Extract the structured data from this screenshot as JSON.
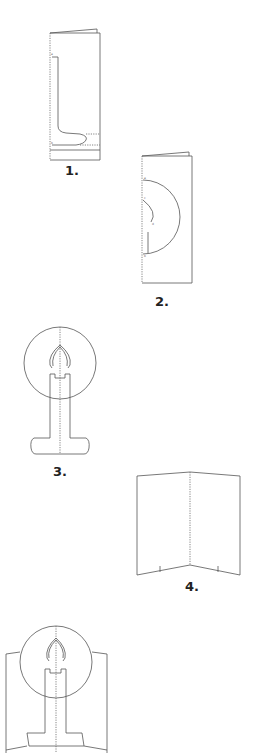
{
  "diagram": {
    "type": "instruction-steps",
    "steps": [
      {
        "label": "1.",
        "description": "Folded card with half-candle shape drawn along fold, cut and fold lines"
      },
      {
        "label": "2.",
        "description": "Folded card with half-circle halo and flame curve drawn along fold"
      },
      {
        "label": "3.",
        "description": "Cut-out candle with circular halo and flame, unfolded"
      },
      {
        "label": "4.",
        "description": "Open base card with center fold and slot marks"
      },
      {
        "label": "",
        "description": "Candle cut-out inserted into open base card"
      }
    ]
  },
  "colors": {
    "line": "#555555",
    "background": "#ffffff",
    "label": "#222222"
  }
}
